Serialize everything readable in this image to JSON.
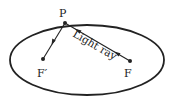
{
  "diagram": {
    "title": "",
    "labels": {
      "point_p": "P",
      "focus_f": "F",
      "focus_f_prime": "F′",
      "ray": "Light ray"
    },
    "colors": {
      "stroke": "#222222",
      "background": "#ffffff"
    }
  }
}
